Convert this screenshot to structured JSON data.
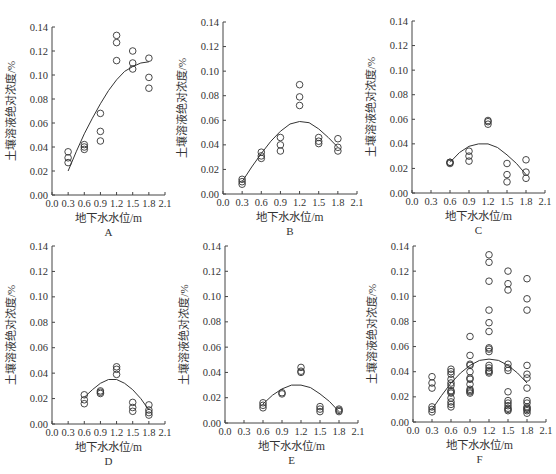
{
  "figure": {
    "common": {
      "xlabel": "地下水水位/m",
      "ylabel": "土壤溶液绝对浓度/%",
      "xlim": [
        0.0,
        2.1
      ],
      "ylim": [
        0.0,
        0.14
      ],
      "xticks": [
        "0.0",
        "0.3",
        "0.6",
        "0.9",
        "1.2",
        "1.5",
        "1.8",
        "2.1"
      ],
      "yticks": [
        "0.00",
        "0.02",
        "0.04",
        "0.06",
        "0.08",
        "0.10",
        "0.12",
        "0.14"
      ]
    }
  },
  "chart_data": [
    {
      "type": "scatter",
      "panel_label": "A",
      "xlabel": "地下水水位/m",
      "ylabel": "土壤溶液绝对浓度/%",
      "xlim": [
        0.0,
        2.1
      ],
      "ylim": [
        0.0,
        0.14
      ],
      "grid": false,
      "points": [
        [
          0.3,
          0.036
        ],
        [
          0.3,
          0.031
        ],
        [
          0.3,
          0.027
        ],
        [
          0.6,
          0.042
        ],
        [
          0.6,
          0.04
        ],
        [
          0.6,
          0.038
        ],
        [
          0.9,
          0.068
        ],
        [
          0.9,
          0.053
        ],
        [
          0.9,
          0.045
        ],
        [
          1.2,
          0.133
        ],
        [
          1.2,
          0.127
        ],
        [
          1.2,
          0.112
        ],
        [
          1.5,
          0.12
        ],
        [
          1.5,
          0.11
        ],
        [
          1.5,
          0.105
        ],
        [
          1.8,
          0.114
        ],
        [
          1.8,
          0.098
        ],
        [
          1.8,
          0.089
        ]
      ],
      "fit_curve": {
        "type": "quadratic",
        "x": [
          0.3,
          0.45,
          0.6,
          0.75,
          0.9,
          1.05,
          1.2,
          1.35,
          1.5,
          1.65,
          1.8
        ],
        "y": [
          0.02,
          0.036,
          0.051,
          0.064,
          0.076,
          0.087,
          0.096,
          0.103,
          0.107,
          0.11,
          0.111
        ]
      }
    },
    {
      "type": "scatter",
      "panel_label": "B",
      "xlabel": "地下水水位/m",
      "ylabel": "土壤溶液绝对浓度/%",
      "xlim": [
        0.0,
        2.1
      ],
      "ylim": [
        0.0,
        0.14
      ],
      "grid": false,
      "points": [
        [
          0.3,
          0.012
        ],
        [
          0.3,
          0.01
        ],
        [
          0.3,
          0.008
        ],
        [
          0.6,
          0.034
        ],
        [
          0.6,
          0.031
        ],
        [
          0.6,
          0.029
        ],
        [
          0.9,
          0.046
        ],
        [
          0.9,
          0.04
        ],
        [
          0.9,
          0.035
        ],
        [
          1.2,
          0.089
        ],
        [
          1.2,
          0.079
        ],
        [
          1.2,
          0.072
        ],
        [
          1.5,
          0.046
        ],
        [
          1.5,
          0.043
        ],
        [
          1.5,
          0.041
        ],
        [
          1.8,
          0.045
        ],
        [
          1.8,
          0.038
        ],
        [
          1.8,
          0.035
        ]
      ],
      "fit_curve": {
        "type": "quadratic",
        "x": [
          0.3,
          0.45,
          0.6,
          0.75,
          0.9,
          1.05,
          1.2,
          1.35,
          1.5,
          1.65,
          1.8
        ],
        "y": [
          0.01,
          0.022,
          0.033,
          0.043,
          0.051,
          0.057,
          0.059,
          0.058,
          0.053,
          0.046,
          0.038
        ]
      }
    },
    {
      "type": "scatter",
      "panel_label": "C",
      "xlabel": "地下水水位/m",
      "ylabel": "土壤溶液绝对浓度/%",
      "xlim": [
        0.0,
        2.1
      ],
      "ylim": [
        0.0,
        0.14
      ],
      "grid": false,
      "points": [
        [
          0.6,
          0.025
        ],
        [
          0.6,
          0.024
        ],
        [
          0.6,
          0.025
        ],
        [
          0.9,
          0.034
        ],
        [
          0.9,
          0.03
        ],
        [
          0.9,
          0.026
        ],
        [
          1.2,
          0.059
        ],
        [
          1.2,
          0.058
        ],
        [
          1.2,
          0.056
        ],
        [
          1.5,
          0.024
        ],
        [
          1.5,
          0.015
        ],
        [
          1.5,
          0.009
        ],
        [
          1.8,
          0.027
        ],
        [
          1.8,
          0.017
        ],
        [
          1.8,
          0.012
        ]
      ],
      "fit_curve": {
        "type": "quadratic",
        "x": [
          0.6,
          0.75,
          0.9,
          1.05,
          1.2,
          1.35,
          1.5,
          1.65,
          1.8
        ],
        "y": [
          0.025,
          0.033,
          0.038,
          0.04,
          0.04,
          0.037,
          0.031,
          0.024,
          0.015
        ]
      }
    },
    {
      "type": "scatter",
      "panel_label": "D",
      "xlabel": "地下水水位/m",
      "ylabel": "土壤溶液绝对浓度/%",
      "xlim": [
        0.0,
        2.1
      ],
      "ylim": [
        0.0,
        0.14
      ],
      "grid": false,
      "points": [
        [
          0.6,
          0.023
        ],
        [
          0.6,
          0.019
        ],
        [
          0.6,
          0.016
        ],
        [
          0.9,
          0.026
        ],
        [
          0.9,
          0.025
        ],
        [
          0.9,
          0.024
        ],
        [
          1.2,
          0.045
        ],
        [
          1.2,
          0.043
        ],
        [
          1.2,
          0.039
        ],
        [
          1.5,
          0.017
        ],
        [
          1.5,
          0.013
        ],
        [
          1.5,
          0.01
        ],
        [
          1.8,
          0.015
        ],
        [
          1.8,
          0.011
        ],
        [
          1.8,
          0.009
        ],
        [
          1.8,
          0.007
        ]
      ],
      "fit_curve": {
        "type": "quadratic",
        "x": [
          0.6,
          0.75,
          0.9,
          1.05,
          1.2,
          1.35,
          1.5,
          1.65,
          1.8
        ],
        "y": [
          0.021,
          0.027,
          0.032,
          0.035,
          0.035,
          0.032,
          0.027,
          0.02,
          0.011
        ]
      }
    },
    {
      "type": "scatter",
      "panel_label": "E",
      "xlabel": "地下水水位/m",
      "ylabel": "土壤溶液绝对浓度/%",
      "xlim": [
        0.0,
        2.1
      ],
      "ylim": [
        0.0,
        0.14
      ],
      "grid": false,
      "points": [
        [
          0.6,
          0.016
        ],
        [
          0.6,
          0.014
        ],
        [
          0.6,
          0.012
        ],
        [
          0.9,
          0.024
        ],
        [
          0.9,
          0.023
        ],
        [
          1.2,
          0.044
        ],
        [
          1.2,
          0.041
        ],
        [
          1.2,
          0.04
        ],
        [
          1.5,
          0.013
        ],
        [
          1.5,
          0.011
        ],
        [
          1.5,
          0.009
        ],
        [
          1.8,
          0.011
        ],
        [
          1.8,
          0.01
        ],
        [
          1.8,
          0.009
        ]
      ],
      "fit_curve": {
        "type": "quadratic",
        "x": [
          0.6,
          0.75,
          0.9,
          1.05,
          1.2,
          1.35,
          1.5,
          1.65,
          1.8
        ],
        "y": [
          0.015,
          0.022,
          0.027,
          0.03,
          0.03,
          0.028,
          0.023,
          0.017,
          0.009
        ]
      }
    },
    {
      "type": "scatter",
      "panel_label": "F",
      "xlabel": "地下水水位/m",
      "ylabel": "土壤溶液绝对浓度/%",
      "xlim": [
        0.0,
        2.1
      ],
      "ylim": [
        0.0,
        0.14
      ],
      "grid": false,
      "points": [
        [
          0.3,
          0.036
        ],
        [
          0.3,
          0.031
        ],
        [
          0.3,
          0.027
        ],
        [
          0.3,
          0.012
        ],
        [
          0.3,
          0.01
        ],
        [
          0.3,
          0.008
        ],
        [
          0.6,
          0.042
        ],
        [
          0.6,
          0.04
        ],
        [
          0.6,
          0.038
        ],
        [
          0.6,
          0.034
        ],
        [
          0.6,
          0.031
        ],
        [
          0.6,
          0.029
        ],
        [
          0.6,
          0.025
        ],
        [
          0.6,
          0.024
        ],
        [
          0.6,
          0.023
        ],
        [
          0.6,
          0.019
        ],
        [
          0.6,
          0.016
        ],
        [
          0.6,
          0.014
        ],
        [
          0.6,
          0.012
        ],
        [
          0.9,
          0.068
        ],
        [
          0.9,
          0.053
        ],
        [
          0.9,
          0.046
        ],
        [
          0.9,
          0.045
        ],
        [
          0.9,
          0.04
        ],
        [
          0.9,
          0.035
        ],
        [
          0.9,
          0.034
        ],
        [
          0.9,
          0.03
        ],
        [
          0.9,
          0.026
        ],
        [
          0.9,
          0.025
        ],
        [
          0.9,
          0.024
        ],
        [
          0.9,
          0.023
        ],
        [
          1.2,
          0.133
        ],
        [
          1.2,
          0.127
        ],
        [
          1.2,
          0.112
        ],
        [
          1.2,
          0.089
        ],
        [
          1.2,
          0.079
        ],
        [
          1.2,
          0.072
        ],
        [
          1.2,
          0.059
        ],
        [
          1.2,
          0.058
        ],
        [
          1.2,
          0.056
        ],
        [
          1.2,
          0.045
        ],
        [
          1.2,
          0.043
        ],
        [
          1.2,
          0.041
        ],
        [
          1.2,
          0.04
        ],
        [
          1.2,
          0.039
        ],
        [
          1.5,
          0.12
        ],
        [
          1.5,
          0.11
        ],
        [
          1.5,
          0.105
        ],
        [
          1.5,
          0.046
        ],
        [
          1.5,
          0.043
        ],
        [
          1.5,
          0.041
        ],
        [
          1.5,
          0.024
        ],
        [
          1.5,
          0.017
        ],
        [
          1.5,
          0.015
        ],
        [
          1.5,
          0.013
        ],
        [
          1.5,
          0.011
        ],
        [
          1.5,
          0.01
        ],
        [
          1.5,
          0.009
        ],
        [
          1.8,
          0.114
        ],
        [
          1.8,
          0.098
        ],
        [
          1.8,
          0.089
        ],
        [
          1.8,
          0.045
        ],
        [
          1.8,
          0.038
        ],
        [
          1.8,
          0.035
        ],
        [
          1.8,
          0.027
        ],
        [
          1.8,
          0.017
        ],
        [
          1.8,
          0.015
        ],
        [
          1.8,
          0.012
        ],
        [
          1.8,
          0.011
        ],
        [
          1.8,
          0.01
        ],
        [
          1.8,
          0.009
        ],
        [
          1.8,
          0.007
        ]
      ],
      "fit_curve": {
        "type": "quadratic",
        "x": [
          0.3,
          0.45,
          0.6,
          0.75,
          0.9,
          1.05,
          1.2,
          1.35,
          1.5,
          1.65,
          1.8
        ],
        "y": [
          0.01,
          0.021,
          0.031,
          0.039,
          0.045,
          0.049,
          0.05,
          0.049,
          0.045,
          0.039,
          0.031
        ]
      }
    }
  ],
  "layout": {
    "panels": [
      {
        "x0": 52,
        "y_top": 27,
        "y_bottom": 195,
        "x_end": 165
      },
      {
        "x0": 223,
        "y_top": 22,
        "y_bottom": 194,
        "x_end": 357
      },
      {
        "x0": 412,
        "y_top": 21,
        "y_bottom": 193,
        "x_end": 545
      },
      {
        "x0": 52,
        "y_top": 246,
        "y_bottom": 424,
        "x_end": 165
      },
      {
        "x0": 225,
        "y_top": 246,
        "y_bottom": 423,
        "x_end": 358
      },
      {
        "x0": 413,
        "y_top": 246,
        "y_bottom": 422,
        "x_end": 546
      }
    ]
  }
}
